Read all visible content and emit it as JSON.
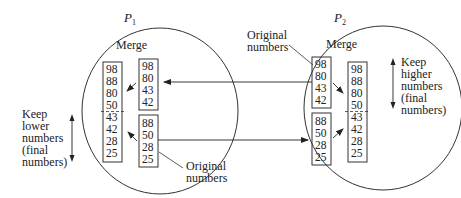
{
  "diagram": {
    "processors": [
      {
        "label": "P",
        "subscript": "1",
        "merge_label": "Merge",
        "merged_numbers": [
          "98",
          "88",
          "80",
          "50",
          "43",
          "42",
          "28",
          "25"
        ],
        "input_top": [
          "98",
          "80",
          "43",
          "42"
        ],
        "input_bottom": [
          "88",
          "50",
          "28",
          "25"
        ],
        "side_note": [
          "Keep",
          "lower",
          "numbers",
          "(final",
          "numbers)"
        ],
        "original_label": [
          "Original",
          "numbers"
        ]
      },
      {
        "label": "P",
        "subscript": "2",
        "merge_label": "Merge",
        "merged_numbers": [
          "98",
          "88",
          "80",
          "50",
          "43",
          "42",
          "28",
          "25"
        ],
        "input_top": [
          "98",
          "80",
          "43",
          "42"
        ],
        "input_bottom": [
          "88",
          "50",
          "28",
          "25"
        ],
        "side_note": [
          "Keep",
          "higher",
          "numbers",
          "(final",
          "numbers)"
        ],
        "original_label": [
          "Original",
          "numbers"
        ]
      }
    ],
    "colors": {
      "line": "#333333",
      "text": "#222222",
      "background": "#ffffff"
    }
  }
}
